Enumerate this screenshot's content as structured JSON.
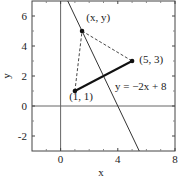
{
  "chart_data": {
    "type": "line",
    "title": "",
    "xlabel": "x",
    "ylabel": "y",
    "xlim": [
      -2,
      8
    ],
    "ylim": [
      -3,
      7
    ],
    "grid": false,
    "x_ticks": [
      0,
      4,
      8
    ],
    "x_tick_labels": [
      "0",
      "4",
      "8"
    ],
    "x_minor_ticks": [
      -1,
      1,
      2,
      3,
      5,
      6,
      7
    ],
    "y_ticks": [
      -2,
      0,
      2,
      4,
      6
    ],
    "y_tick_labels": [
      "-2",
      "0",
      "2",
      "4",
      "6"
    ],
    "y_minor_ticks": [
      -1,
      1,
      3,
      5
    ],
    "reference_lines": [
      {
        "name": "x-axis",
        "orientation": "horizontal",
        "value": 0
      },
      {
        "name": "y-axis",
        "orientation": "vertical",
        "value": 0
      }
    ],
    "series": [
      {
        "name": "y = -2x + 8",
        "style": "solid-thin",
        "x": [
          0.5,
          5.5
        ],
        "y": [
          7,
          -3
        ]
      },
      {
        "name": "segment (1,1)-(5,3)",
        "style": "solid-thick",
        "x": [
          1,
          5
        ],
        "y": [
          1,
          3
        ]
      },
      {
        "name": "dashed (1,1)-(x,y)",
        "style": "dashed",
        "x": [
          1,
          1.5
        ],
        "y": [
          1,
          5
        ]
      },
      {
        "name": "dashed (x,y)-(5,3)",
        "style": "dashed",
        "x": [
          1.5,
          5
        ],
        "y": [
          5,
          3
        ]
      }
    ],
    "points": [
      {
        "label": "(x, y)",
        "x": 1.5,
        "y": 5
      },
      {
        "label": "(5, 3)",
        "x": 5,
        "y": 3
      },
      {
        "label": "(1, 1)",
        "x": 1,
        "y": 1
      }
    ],
    "annotations": [
      {
        "text": "(x, y)",
        "x": 1.8,
        "y": 5.7
      },
      {
        "text": "(5, 3)",
        "x": 5.5,
        "y": 2.9
      },
      {
        "text": "(1, 1)",
        "x": 0.6,
        "y": 0.4
      },
      {
        "text": "y = −2x + 8",
        "x": 3.8,
        "y": 1.1
      }
    ]
  }
}
